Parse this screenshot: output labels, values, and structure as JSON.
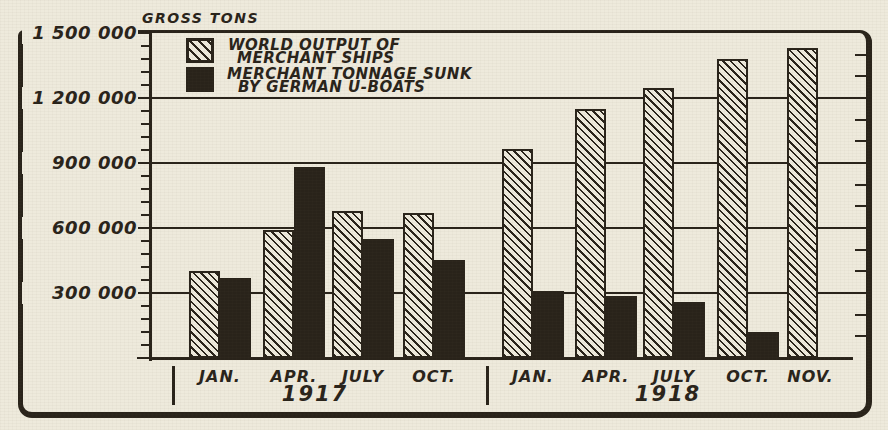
{
  "page": {
    "title": "GROSS TONS"
  },
  "colors": {
    "paper": "#eeeadc",
    "ink": "#29231a"
  },
  "legend": {
    "items": [
      {
        "swatch": "hatched",
        "line1": "WORLD OUTPUT OF",
        "line2": "MERCHANT SHIPS"
      },
      {
        "swatch": "solid",
        "line1": "MERCHANT TONNAGE SUNK",
        "line2": "BY GERMAN U-BOATS"
      }
    ]
  },
  "chart_data": {
    "type": "bar",
    "title": "GROSS TONS",
    "unit": "gross tons",
    "ylim": [
      0,
      1500000
    ],
    "grid": "horizontal-major",
    "legend_position": "top-left-inside",
    "y_major_ticks": [
      1500000,
      1200000,
      900000,
      600000,
      300000
    ],
    "y_tick_labels": [
      "1 500 000",
      "1 200 000",
      "900 000",
      "600 000",
      "300 000"
    ],
    "left_minor_tick_step": 60000,
    "right_minor_tick_step": 100000,
    "groups": [
      {
        "year": "1917",
        "categories": [
          "JAN.",
          "APR.",
          "JULY",
          "OCT."
        ],
        "series": [
          {
            "name": "WORLD OUTPUT OF MERCHANT SHIPS",
            "style": "hatched",
            "values": [
              400000,
              590000,
              680000,
              670000
            ]
          },
          {
            "name": "MERCHANT TONNAGE SUNK BY GERMAN U-BOATS",
            "style": "solid",
            "values": [
              370000,
              880000,
              550000,
              450000
            ]
          }
        ]
      },
      {
        "year": "1918",
        "categories": [
          "JAN.",
          "APR.",
          "JULY",
          "OCT.",
          "NOV."
        ],
        "series": [
          {
            "name": "WORLD OUTPUT OF MERCHANT SHIPS",
            "style": "hatched",
            "values": [
              965000,
              1150000,
              1245000,
              1380000,
              1430000
            ]
          },
          {
            "name": "MERCHANT TONNAGE SUNK BY GERMAN U-BOATS",
            "style": "solid",
            "values": [
              310000,
              285000,
              260000,
              120000,
              null
            ]
          }
        ]
      }
    ]
  }
}
